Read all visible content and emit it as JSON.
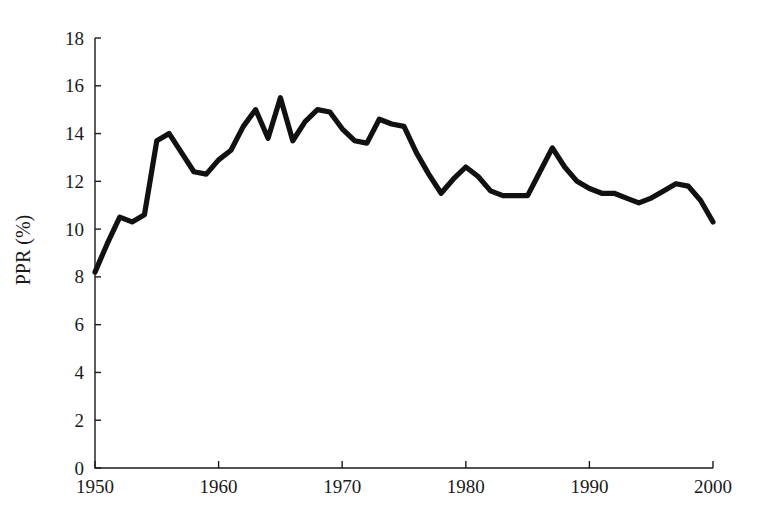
{
  "chart_data": {
    "type": "line",
    "title": "",
    "xlabel": "",
    "ylabel": "PPR (%)",
    "xlim": [
      1950,
      2000
    ],
    "ylim": [
      0,
      18
    ],
    "grid": false,
    "legend": "none",
    "x_ticks": [
      1950,
      1960,
      1970,
      1980,
      1990,
      2000
    ],
    "y_ticks": [
      0,
      2,
      4,
      6,
      8,
      10,
      12,
      14,
      16,
      18
    ],
    "line_color": "#111111",
    "series": [
      {
        "name": "PPR",
        "x": [
          1950,
          1951,
          1952,
          1953,
          1954,
          1955,
          1956,
          1957,
          1958,
          1959,
          1960,
          1961,
          1962,
          1963,
          1964,
          1965,
          1966,
          1967,
          1968,
          1969,
          1970,
          1971,
          1972,
          1973,
          1974,
          1975,
          1976,
          1977,
          1978,
          1979,
          1980,
          1981,
          1982,
          1983,
          1984,
          1985,
          1986,
          1987,
          1988,
          1989,
          1990,
          1991,
          1992,
          1993,
          1994,
          1995,
          1996,
          1997,
          1998,
          1999,
          2000
        ],
        "y": [
          8.2,
          9.4,
          10.5,
          10.3,
          10.6,
          13.7,
          14.0,
          13.2,
          12.4,
          12.3,
          12.9,
          13.3,
          14.3,
          15.0,
          13.8,
          15.5,
          13.7,
          14.5,
          15.0,
          14.9,
          14.2,
          13.7,
          13.6,
          14.6,
          14.4,
          14.3,
          13.2,
          12.3,
          11.5,
          12.1,
          12.6,
          12.2,
          11.6,
          11.4,
          11.4,
          11.4,
          12.4,
          13.4,
          12.6,
          12.0,
          11.7,
          11.5,
          11.5,
          11.3,
          11.1,
          11.3,
          11.6,
          11.9,
          11.8,
          11.2,
          10.3
        ]
      }
    ]
  },
  "axes": {
    "y_title": "PPR (%)"
  }
}
